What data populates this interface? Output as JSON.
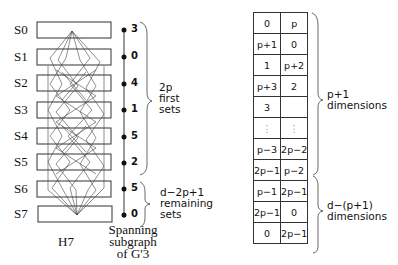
{
  "left_diagram": {
    "sets": [
      "S0",
      "S1",
      "S2",
      "S3",
      "S4",
      "S5",
      "S6",
      "S7"
    ],
    "caption": "H7"
  },
  "middle_diagram": {
    "vertex_labels": [
      "3",
      "0",
      "4",
      "1",
      "5",
      "2",
      "5",
      "0"
    ],
    "caption_lines": [
      "Spanning",
      "subgraph",
      "of G'3"
    ],
    "brace_first": {
      "lines": [
        "2p",
        "first",
        "sets"
      ]
    },
    "brace_remaining": {
      "lines": [
        "d−2p+1",
        "remaining",
        "sets"
      ]
    }
  },
  "right_table": {
    "rows": [
      [
        "0",
        "p"
      ],
      [
        "p+1",
        "0"
      ],
      [
        "1",
        "p+2"
      ],
      [
        "p+3",
        "2"
      ],
      [
        "3",
        ""
      ],
      [
        "⋮",
        "⋮"
      ],
      [
        "p−3",
        "2p−2"
      ],
      [
        "2p−1",
        "p−2"
      ],
      [
        "p−1",
        "2p−1"
      ],
      [
        "2p−1",
        "0"
      ],
      [
        "0",
        "2p−1"
      ]
    ],
    "brace_top": {
      "lines": [
        "p+1",
        "dimensions"
      ]
    },
    "brace_bottom": {
      "lines": [
        "d−(p+1)",
        "dimensions"
      ]
    }
  }
}
